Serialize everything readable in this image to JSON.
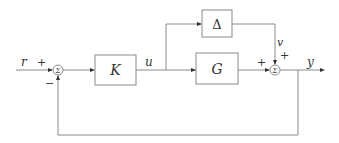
{
  "diagram": {
    "type": "feedback-control-block-diagram",
    "blocks": [
      {
        "id": "K",
        "label": "K"
      },
      {
        "id": "G",
        "label": "G"
      },
      {
        "id": "Delta",
        "label": "Δ"
      }
    ],
    "summing_junctions": [
      {
        "id": "sum1",
        "label": "Σ",
        "inputs": [
          {
            "from": "r",
            "sign": "+"
          },
          {
            "from": "feedback",
            "sign": "−"
          }
        ]
      },
      {
        "id": "sum2",
        "label": "Σ",
        "inputs": [
          {
            "from": "G",
            "sign": "+"
          },
          {
            "from": "Delta",
            "sign": "+"
          }
        ]
      }
    ],
    "signals": {
      "r": "r",
      "u": "u",
      "v": "v",
      "y": "y"
    },
    "signs": {
      "sum1_r": "+",
      "sum1_fb": "−",
      "sum2_g": "+",
      "sum2_v": "+"
    },
    "edges": [
      {
        "from": "r",
        "to": "sum1"
      },
      {
        "from": "sum1",
        "to": "K"
      },
      {
        "from": "K",
        "to": "G",
        "label": "u"
      },
      {
        "from": "K",
        "to": "Delta",
        "label": "u"
      },
      {
        "from": "Delta",
        "to": "sum2",
        "label": "v"
      },
      {
        "from": "G",
        "to": "sum2"
      },
      {
        "from": "sum2",
        "to": "y",
        "label": "y"
      },
      {
        "from": "y",
        "to": "sum1",
        "type": "feedback"
      }
    ]
  }
}
